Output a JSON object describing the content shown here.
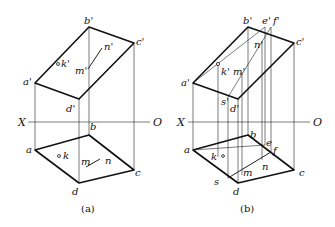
{
  "figure_a": {
    "caption": "(a)",
    "axis": {
      "left": "X",
      "right": "O"
    },
    "front_view": {
      "a": "a'",
      "b": "b'",
      "c": "c'",
      "d": "d'",
      "k": "k'",
      "m": "m'",
      "n": "n'"
    },
    "top_view": {
      "a": "a",
      "b": "b",
      "c": "c",
      "d": "d",
      "k": "k",
      "m": "m",
      "n": "n"
    }
  },
  "figure_b": {
    "caption": "(b)",
    "axis": {
      "left": "X",
      "right": "O"
    },
    "front_view": {
      "a": "a'",
      "b": "b'",
      "c": "c'",
      "d": "d'",
      "e": "e'",
      "f": "f'",
      "k": "k'",
      "m": "m'",
      "n": "n'",
      "s": "s'"
    },
    "top_view": {
      "a": "a",
      "b": "b",
      "c": "c",
      "d": "d",
      "e": "e",
      "f": "f",
      "k": "k",
      "m": "m",
      "n": "n",
      "s": "s"
    }
  }
}
